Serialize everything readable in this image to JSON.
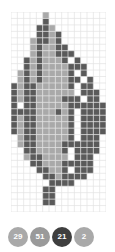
{
  "app": {
    "title": "Bead Pattern Grid"
  },
  "grid": {
    "columns": 15,
    "rows": 31,
    "cell_size": 6.333,
    "gridline_color": "#e2e2e2",
    "background_color": "#ffffff",
    "palette": {
      "light": "#a9a9a9",
      "medium": "#8c8c8c",
      "dark": "#5a5a5a",
      "empty": "#ffffff"
    },
    "legend_keys": [
      "light",
      "medium",
      "dark",
      "empty"
    ],
    "cells": [
      ".....0.........",
      ".....2.........",
      "....220........",
      "....2202.......",
      "...02202.......",
      "...020022......",
      "...0200222.....",
      "..2020002 2....",
      "..2020000222...",
      ".020200002 2...",
      ".0202000022 2..",
      "2022000002 22..",
      "2022000000 222.",
      "20220000222 22.",
      "2 2200000222222",
      "2222000202 2222",
      "2022000002 2222",
      "2022000002 2222",
      "2022000002 2222",
      ".022000002 222.",
      ".0220000222222.",
      "..2200002 2222.",
      "..0220000 222..",
      "...2200022222..",
      "....22002 222..",
      ".....2202222...",
      "......2222.....",
      ".....22........",
      ".....22........",
      ".....22........",
      "..............."
    ]
  },
  "legend": {
    "badges": [
      {
        "label": "29",
        "color": "#a9a9a9",
        "text_color": "#ffffff",
        "selected": false,
        "name": "legend-badge-light"
      },
      {
        "label": "51",
        "color": "#9a9a9a",
        "text_color": "#ffffff",
        "selected": false,
        "name": "legend-badge-medium"
      },
      {
        "label": "21",
        "color": "#3f3f3f",
        "text_color": "#ffffff",
        "selected": true,
        "name": "legend-badge-dark"
      },
      {
        "label": "2",
        "color": "#a9a9a9",
        "text_color": "#ffffff",
        "selected": false,
        "name": "legend-badge-extra"
      }
    ]
  }
}
